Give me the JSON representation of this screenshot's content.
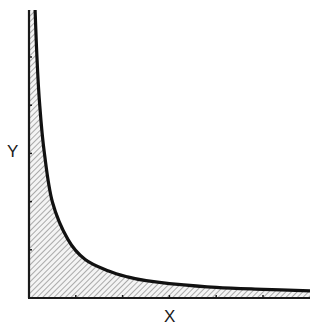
{
  "chart_data": {
    "type": "area",
    "title": "",
    "xlabel": "X",
    "ylabel": "Y",
    "grid": false,
    "legend": null,
    "ticks": {
      "x_count": 6,
      "y_count": 5,
      "x_tick_labels": [],
      "y_tick_labels": []
    },
    "xlim": [
      0,
      6
    ],
    "ylim": [
      0,
      6
    ],
    "series": [
      {
        "name": "curve",
        "x": [
          0.13,
          0.17,
          0.23,
          0.33,
          0.5,
          0.83,
          1.2,
          1.7,
          2.1,
          2.5,
          3.0,
          4.0,
          5.0,
          6.0
        ],
        "y": [
          6.0,
          5.0,
          4.0,
          3.0,
          2.0,
          1.22,
          0.8,
          0.56,
          0.44,
          0.36,
          0.3,
          0.22,
          0.18,
          0.15
        ]
      }
    ],
    "fill": "hatched",
    "colors": {
      "curve": "#111111",
      "axis": "#1a1a1a",
      "hatch": "#8a8a8a",
      "hatch_bg": "#f2f2f2"
    }
  },
  "labels": {
    "x": "X",
    "y": "Y"
  }
}
